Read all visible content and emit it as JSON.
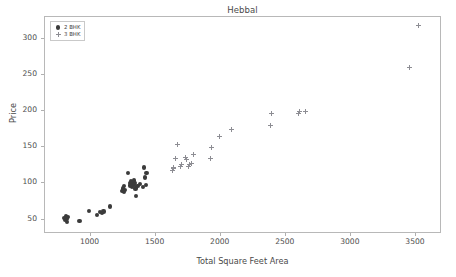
{
  "chart_data": {
    "type": "scatter",
    "title": "Hebbal",
    "xlabel": "Total Square Feet Area",
    "ylabel": "Price",
    "xlim": [
      650,
      3700
    ],
    "ylim": [
      30,
      330
    ],
    "xticks": [
      1000,
      1500,
      2000,
      2500,
      3000,
      3500
    ],
    "yticks": [
      50,
      100,
      150,
      200,
      250,
      300
    ],
    "grid": false,
    "legend_position": "upper left",
    "colors": {
      "series_2bhk": "#3b3b3b",
      "series_3bhk": "#8d8d93",
      "axes_edge": "#b8b8b8",
      "text": "#4a4a4a"
    },
    "series": [
      {
        "name": "2 BHK",
        "marker": "circle",
        "color": "#3b3b3b",
        "points": [
          [
            800,
            52
          ],
          [
            805,
            49
          ],
          [
            810,
            55
          ],
          [
            815,
            51
          ],
          [
            820,
            47
          ],
          [
            825,
            53
          ],
          [
            915,
            48
          ],
          [
            990,
            62
          ],
          [
            1050,
            56
          ],
          [
            1075,
            60
          ],
          [
            1090,
            59
          ],
          [
            1100,
            61
          ],
          [
            1150,
            68
          ],
          [
            1245,
            90
          ],
          [
            1250,
            93
          ],
          [
            1255,
            88
          ],
          [
            1260,
            96
          ],
          [
            1265,
            91
          ],
          [
            1290,
            114
          ],
          [
            1300,
            100
          ],
          [
            1305,
            97
          ],
          [
            1310,
            103
          ],
          [
            1315,
            99
          ],
          [
            1320,
            95
          ],
          [
            1325,
            101
          ],
          [
            1330,
            98
          ],
          [
            1335,
            104
          ],
          [
            1340,
            100
          ],
          [
            1345,
            93
          ],
          [
            1350,
            83
          ],
          [
            1360,
            96
          ],
          [
            1380,
            99
          ],
          [
            1400,
            95
          ],
          [
            1410,
            122
          ],
          [
            1420,
            108
          ],
          [
            1425,
            98
          ],
          [
            1430,
            114
          ]
        ]
      },
      {
        "name": "3 BHK",
        "marker": "plus",
        "color": "#8d8d93",
        "points": [
          [
            1630,
            118
          ],
          [
            1635,
            120
          ],
          [
            1640,
            122
          ],
          [
            1650,
            135
          ],
          [
            1665,
            154
          ],
          [
            1690,
            124
          ],
          [
            1700,
            126
          ],
          [
            1730,
            136
          ],
          [
            1740,
            133
          ],
          [
            1750,
            124
          ],
          [
            1760,
            126
          ],
          [
            1775,
            127
          ],
          [
            1790,
            140
          ],
          [
            1920,
            134
          ],
          [
            1930,
            150
          ],
          [
            1990,
            165
          ],
          [
            2080,
            175
          ],
          [
            2385,
            180
          ],
          [
            2390,
            196
          ],
          [
            2600,
            197
          ],
          [
            2605,
            199
          ],
          [
            2650,
            199
          ],
          [
            3450,
            260
          ],
          [
            3520,
            318
          ]
        ]
      }
    ]
  },
  "legend": {
    "entries": [
      {
        "label": "2 BHK"
      },
      {
        "label": "3 BHK"
      }
    ]
  }
}
